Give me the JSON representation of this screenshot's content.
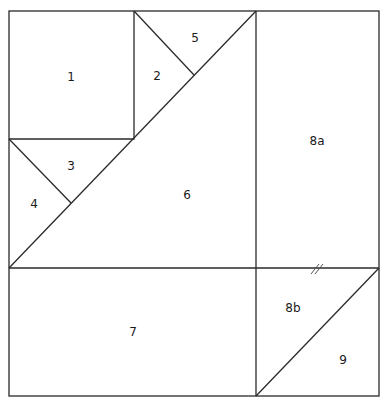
{
  "diagram": {
    "type": "quilt-block-piecing-diagram",
    "line_color": "#2a2a2a",
    "background": "#ffffff",
    "pieces": [
      {
        "id": "1",
        "label": "1",
        "shape": "square",
        "x": 71,
        "y": 77
      },
      {
        "id": "2",
        "label": "2",
        "shape": "triangle",
        "x": 157,
        "y": 76
      },
      {
        "id": "5",
        "label": "5",
        "shape": "triangle",
        "x": 195,
        "y": 38
      },
      {
        "id": "3",
        "label": "3",
        "shape": "triangle",
        "x": 71,
        "y": 166
      },
      {
        "id": "4",
        "label": "4",
        "shape": "triangle",
        "x": 34,
        "y": 204
      },
      {
        "id": "6",
        "label": "6",
        "shape": "large-triangle",
        "x": 187,
        "y": 195
      },
      {
        "id": "8a",
        "label": "8a",
        "shape": "rectangle",
        "x": 317,
        "y": 141
      },
      {
        "id": "7",
        "label": "7",
        "shape": "rectangle",
        "x": 133,
        "y": 332
      },
      {
        "id": "8b",
        "label": "8b",
        "shape": "triangle",
        "x": 293,
        "y": 308
      },
      {
        "id": "9",
        "label": "9",
        "shape": "triangle",
        "x": 343,
        "y": 360
      }
    ],
    "annotations": [
      {
        "type": "seam-mark",
        "symbol": "//",
        "x": 320,
        "y": 268
      }
    ]
  }
}
